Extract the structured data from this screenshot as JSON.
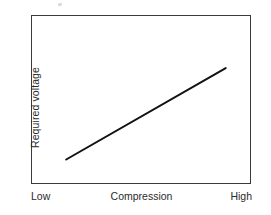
{
  "chart_data": {
    "type": "line",
    "title": "",
    "subtitle": "",
    "xlabel": "Compression",
    "ylabel": "Required voltage",
    "xticklabels": [
      "Low",
      "High"
    ],
    "yticklabels": [],
    "grid": false,
    "legend": null,
    "xlim": [
      0,
      1
    ],
    "ylim": [
      0,
      1
    ],
    "series": [
      {
        "name": "Required voltage vs Compression",
        "color": "#111111",
        "linewidth": 2,
        "x": [
          0.16,
          0.885
        ],
        "y": [
          0.145,
          0.686
        ],
        "annotation": "monotonically increasing straight line"
      }
    ],
    "axis_box": {
      "left_px": 31,
      "top_px": 15,
      "width_px": 220,
      "height_px": 169,
      "border_color": "#3a3a3a"
    },
    "background_color": "#ffffff"
  },
  "figure": {
    "y_axis_title": "Required voltage",
    "x_axis_title": "Compression",
    "x_low_label": "Low",
    "x_high_label": "High"
  }
}
